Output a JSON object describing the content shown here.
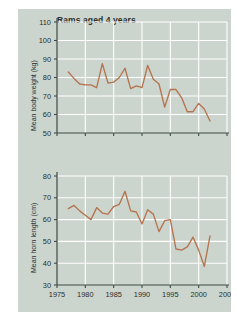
{
  "figure": {
    "clipped_top_text": "",
    "background_color": "#ccd5cd",
    "page_color": "#ffffff",
    "grid_color": "#ffffff",
    "line_color": "#b5734e",
    "axis_color": "#3c4b42",
    "text_color": "#2a2f2c",
    "title": "Rams aged 4 years"
  },
  "chart_data": [
    {
      "type": "line",
      "id": "mean-body-weight",
      "title": "Rams aged 4 years",
      "xlabel": "",
      "ylabel": "Mean body weight (kg)",
      "xlim": [
        1975,
        2005
      ],
      "ylim": [
        50,
        110
      ],
      "xticks": [
        1975,
        1980,
        1985,
        1990,
        1995,
        2000,
        2005
      ],
      "yticks": [
        50,
        60,
        70,
        80,
        90,
        100,
        110
      ],
      "xtick_labels": [
        "1975",
        "1980",
        "1985",
        "1990",
        "1995",
        "2000",
        "2005"
      ],
      "ytick_labels": [
        "50",
        "60",
        "70",
        "80",
        "90",
        "100",
        "110"
      ],
      "grid": true,
      "legend": "none",
      "series": [
        {
          "name": "Mean body weight (kg)",
          "color": "#b5734e",
          "x": [
            1977,
            1978,
            1979,
            1980,
            1981,
            1982,
            1983,
            1984,
            1985,
            1986,
            1987,
            1988,
            1989,
            1990,
            1991,
            1992,
            1993,
            1994,
            1995,
            1996,
            1997,
            1998,
            1999,
            2000,
            2001,
            2002
          ],
          "y": [
            83.0,
            79.5,
            76.5,
            76.0,
            76.0,
            74.5,
            87.5,
            77.0,
            77.5,
            80.0,
            85.0,
            74.0,
            75.5,
            74.5,
            86.5,
            79.0,
            76.5,
            64.0,
            73.5,
            73.5,
            69.0,
            61.5,
            61.5,
            66.0,
            63.0,
            56.5
          ]
        }
      ]
    },
    {
      "type": "line",
      "id": "mean-horn-length",
      "title": "",
      "xlabel": "",
      "ylabel": "Mean horn length (cm)",
      "xlim": [
        1975,
        2005
      ],
      "ylim": [
        30,
        80
      ],
      "xticks": [
        1975,
        1980,
        1985,
        1990,
        1995,
        2000,
        2005
      ],
      "yticks": [
        30,
        40,
        50,
        60,
        70,
        80
      ],
      "xtick_labels": [
        "1975",
        "1980",
        "1985",
        "1990",
        "1995",
        "2000",
        "2005"
      ],
      "ytick_labels": [
        "30",
        "40",
        "50",
        "60",
        "70",
        "80"
      ],
      "grid": true,
      "legend": "none",
      "series": [
        {
          "name": "Mean horn length (cm)",
          "color": "#b5734e",
          "x": [
            1977,
            1978,
            1979,
            1980,
            1981,
            1982,
            1983,
            1984,
            1985,
            1986,
            1987,
            1988,
            1989,
            1990,
            1991,
            1992,
            1993,
            1994,
            1995,
            1996,
            1997,
            1998,
            1999,
            2000,
            2001,
            2002
          ],
          "y": [
            65.0,
            66.5,
            64.0,
            62.0,
            60.0,
            65.5,
            63.0,
            62.5,
            66.0,
            67.0,
            73.0,
            64.0,
            63.5,
            58.0,
            64.5,
            62.5,
            54.5,
            59.5,
            60.0,
            46.5,
            46.0,
            47.5,
            52.0,
            46.0,
            38.5,
            52.5
          ]
        }
      ]
    }
  ]
}
